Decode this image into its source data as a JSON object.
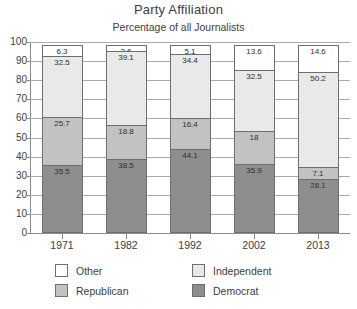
{
  "chart_data": {
    "type": "bar",
    "subtype": "stacked-column-100",
    "title": "Party Affiliation",
    "subtitle": "Percentage of all Journalists",
    "xlabel": "",
    "ylabel": "",
    "ylim": [
      0,
      100
    ],
    "yticks": [
      0,
      10,
      20,
      30,
      40,
      50,
      60,
      70,
      80,
      90,
      100
    ],
    "grid": true,
    "legend_position": "bottom",
    "categories": [
      "1971",
      "1982",
      "1992",
      "2002",
      "2013"
    ],
    "series": [
      {
        "name": "Democrat",
        "color": "#8e8e8e",
        "values": [
          35.5,
          38.5,
          44.1,
          35.9,
          28.1
        ]
      },
      {
        "name": "Republican",
        "color": "#c2c2c2",
        "values": [
          25.7,
          18.8,
          16.4,
          18.0,
          7.1
        ]
      },
      {
        "name": "Independent",
        "color": "#e9e9e9",
        "values": [
          32.5,
          39.1,
          34.4,
          32.5,
          50.2
        ]
      },
      {
        "name": "Other",
        "color": "#ffffff",
        "values": [
          6.3,
          3.6,
          5.1,
          13.6,
          14.6
        ]
      }
    ],
    "bars": [
      {
        "category": "1971",
        "segments": [
          {
            "name": "Other",
            "value": 6.3,
            "label": "6.3"
          },
          {
            "name": "Independent",
            "value": 32.5,
            "label": "32.5"
          },
          {
            "name": "Republican",
            "value": 25.7,
            "label": "25.7"
          },
          {
            "name": "Democrat",
            "value": 35.5,
            "label": "35.5"
          }
        ]
      },
      {
        "category": "1982",
        "segments": [
          {
            "name": "Other",
            "value": 3.6,
            "label": "3.6"
          },
          {
            "name": "Independent",
            "value": 39.1,
            "label": "39.1"
          },
          {
            "name": "Republican",
            "value": 18.8,
            "label": "18.8"
          },
          {
            "name": "Democrat",
            "value": 38.5,
            "label": "38.5"
          }
        ]
      },
      {
        "category": "1992",
        "segments": [
          {
            "name": "Other",
            "value": 5.1,
            "label": "5.1"
          },
          {
            "name": "Independent",
            "value": 34.4,
            "label": "34.4"
          },
          {
            "name": "Republican",
            "value": 16.4,
            "label": "16.4"
          },
          {
            "name": "Democrat",
            "value": 44.1,
            "label": "44.1"
          }
        ]
      },
      {
        "category": "2002",
        "segments": [
          {
            "name": "Other",
            "value": 13.6,
            "label": "13.6"
          },
          {
            "name": "Independent",
            "value": 32.5,
            "label": "32.5"
          },
          {
            "name": "Republican",
            "value": 18.0,
            "label": "18"
          },
          {
            "name": "Democrat",
            "value": 35.9,
            "label": "35.9"
          }
        ]
      },
      {
        "category": "2013",
        "segments": [
          {
            "name": "Other",
            "value": 14.6,
            "label": "14.6"
          },
          {
            "name": "Independent",
            "value": 50.2,
            "label": "50.2"
          },
          {
            "name": "Republican",
            "value": 7.1,
            "label": "7.1"
          },
          {
            "name": "Democrat",
            "value": 28.1,
            "label": "28.1"
          }
        ]
      }
    ],
    "legend": [
      {
        "label": "Other",
        "color": "#ffffff",
        "swatch_class": "seg-other"
      },
      {
        "label": "Independent",
        "color": "#e9e9e9",
        "swatch_class": "seg-independent"
      },
      {
        "label": "Republican",
        "color": "#c2c2c2",
        "swatch_class": "seg-republican"
      },
      {
        "label": "Democrat",
        "color": "#8e8e8e",
        "swatch_class": "seg-democrat"
      }
    ]
  }
}
